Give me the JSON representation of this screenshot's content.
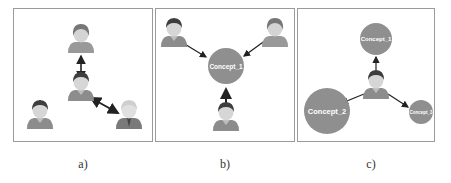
{
  "panels": [
    {
      "id": "a",
      "caption": "a)",
      "description": "person-to-person links",
      "nodes": [
        {
          "type": "person",
          "name": "person-top"
        },
        {
          "type": "person",
          "name": "person-center"
        },
        {
          "type": "person",
          "name": "person-bottom-left"
        },
        {
          "type": "person",
          "name": "person-bottom-right"
        }
      ],
      "edges": [
        {
          "from": "person-top",
          "to": "person-center",
          "direction": "bidirectional"
        },
        {
          "from": "person-center",
          "to": "person-bottom-right",
          "direction": "bidirectional"
        }
      ]
    },
    {
      "id": "b",
      "caption": "b)",
      "description": "persons linked to a concept",
      "nodes": [
        {
          "type": "person",
          "name": "person-top-left"
        },
        {
          "type": "person",
          "name": "person-top-right"
        },
        {
          "type": "person",
          "name": "person-bottom"
        },
        {
          "type": "concept",
          "label": "Concept_1"
        }
      ],
      "edges": [
        {
          "from": "person-top-left",
          "to": "Concept_1"
        },
        {
          "from": "person-top-right",
          "to": "Concept_1"
        },
        {
          "from": "person-bottom",
          "to": "Concept_1"
        }
      ]
    },
    {
      "id": "c",
      "caption": "c)",
      "description": "person linked to several concepts",
      "nodes": [
        {
          "type": "person",
          "name": "person-center"
        },
        {
          "type": "concept",
          "label": "Concept_1"
        },
        {
          "type": "concept",
          "label": "Concept_2"
        },
        {
          "type": "concept",
          "label": "Concept_3"
        }
      ],
      "edges": [
        {
          "from": "person-center",
          "to": "Concept_1"
        },
        {
          "from": "person-center",
          "to": "Concept_2"
        },
        {
          "from": "person-center",
          "to": "Concept_3"
        }
      ]
    }
  ],
  "colors": {
    "concept_fill": "#8f8f8f",
    "person_body": "#8c8c8c",
    "person_hair": "#3a3a3a",
    "person_face": "#d8d8d8",
    "arrow": "#222222",
    "border": "#9a9a9a"
  }
}
